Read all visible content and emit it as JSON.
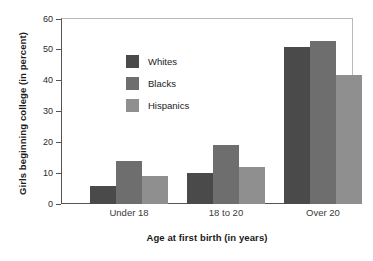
{
  "chart_data": {
    "type": "bar",
    "title": "",
    "xlabel": "Age at first birth (in years)",
    "ylabel": "Girls beginning college (in percent)",
    "categories": [
      "Under 18",
      "18 to 20",
      "Over 20"
    ],
    "series": [
      {
        "name": "Whites",
        "color": "#4a4a4a",
        "values": [
          6,
          10,
          51
        ]
      },
      {
        "name": "Blacks",
        "color": "#6e6e6e",
        "values": [
          14,
          19,
          53
        ]
      },
      {
        "name": "Hispanics",
        "color": "#8f8f8f",
        "values": [
          9,
          12,
          42
        ]
      }
    ],
    "ylim": [
      0,
      60
    ],
    "yticks": [
      0,
      10,
      20,
      30,
      40,
      50,
      60
    ],
    "ytick_labels": [
      "0",
      "10",
      "20",
      "30",
      "40",
      "50",
      "60"
    ],
    "grid": false,
    "legend_position": "upper-left-inside",
    "frame_color": "#b9b9b9",
    "axis_color": "#545454",
    "background": "#ffffff"
  }
}
